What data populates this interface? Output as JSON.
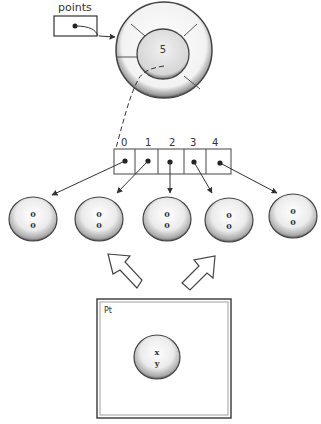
{
  "variable": {
    "label": "points"
  },
  "array_object": {
    "length_value": "5"
  },
  "array": {
    "indices": [
      "0",
      "1",
      "2",
      "3",
      "4"
    ]
  },
  "point_objects": [
    {
      "x": "0",
      "y": "0"
    },
    {
      "x": "0",
      "y": "0"
    },
    {
      "x": "0",
      "y": "0"
    },
    {
      "x": "0",
      "y": "0"
    },
    {
      "x": "0",
      "y": "0"
    }
  ],
  "class_box": {
    "title": "Pt",
    "fields": {
      "x": "x",
      "y": "y"
    }
  },
  "colors": {
    "stroke": "#333333",
    "fill_light": "#f4f4f4",
    "fill_shade": "#c8c8c8"
  }
}
